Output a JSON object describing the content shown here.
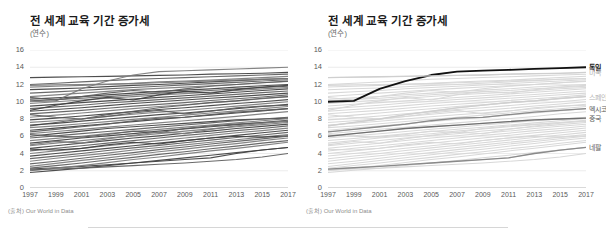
{
  "figure": {
    "divider_visible": true
  },
  "panels": [
    {
      "id": "left",
      "title": "전 세계 교육 기간 증가세",
      "subtitle": "(연수)",
      "source": "(출처) Our World in Data",
      "highlight_mode": "none",
      "country_labels": []
    },
    {
      "id": "right",
      "title": "전 세계 교육 기간 증가세",
      "subtitle": "(연수)",
      "source": "(출처) Our World in Data",
      "highlight_mode": "selected",
      "country_labels": [
        {
          "name": "독일",
          "value": 14.0,
          "style": "hl"
        },
        {
          "name": "미국",
          "value": 13.4,
          "style": "dim"
        },
        {
          "name": "스페인",
          "value": 10.6,
          "style": "dim"
        },
        {
          "name": "멕시코",
          "value": 9.2,
          "style": "mid"
        },
        {
          "name": "중국",
          "value": 8.1,
          "style": "mid"
        },
        {
          "name": "네팔",
          "value": 4.7,
          "style": "mid"
        }
      ]
    }
  ],
  "chart_data": {
    "type": "line",
    "title": "전 세계 교육 기간 증가세",
    "subtitle": "(연수)",
    "xlabel": "",
    "ylabel": "(연수)",
    "source": "(출처) Our World in Data",
    "grid": true,
    "legend_position": "right-inline-labels",
    "xlim": [
      1997,
      2017
    ],
    "ylim": [
      0,
      16
    ],
    "yticks": [
      0,
      2,
      4,
      6,
      8,
      10,
      12,
      14,
      16
    ],
    "xticks": [
      1997,
      1999,
      2001,
      2003,
      2005,
      2007,
      2009,
      2011,
      2013,
      2015,
      2017
    ],
    "x": [
      1997,
      1999,
      2001,
      2003,
      2005,
      2007,
      2009,
      2011,
      2013,
      2015,
      2017
    ],
    "highlighted_series": [
      {
        "name": "독일",
        "color": "#111111",
        "width": 1.8,
        "values": [
          10.0,
          10.1,
          11.5,
          12.4,
          13.1,
          13.5,
          13.6,
          13.7,
          13.8,
          13.9,
          14.0
        ]
      },
      {
        "name": "미국",
        "color": "#cfcfcf",
        "width": 1.3,
        "values": [
          12.8,
          12.85,
          12.9,
          12.95,
          13.0,
          13.05,
          13.1,
          13.2,
          13.25,
          13.3,
          13.4
        ]
      },
      {
        "name": "스페인",
        "color": "#cfcfcf",
        "width": 1.3,
        "values": [
          7.2,
          7.6,
          8.0,
          8.5,
          8.9,
          9.3,
          9.6,
          9.9,
          10.1,
          10.4,
          10.6
        ]
      },
      {
        "name": "멕시코",
        "color": "#8a8a8a",
        "width": 1.3,
        "values": [
          6.5,
          6.8,
          7.1,
          7.4,
          7.8,
          8.1,
          8.2,
          8.5,
          8.8,
          9.0,
          9.2
        ]
      },
      {
        "name": "중국",
        "color": "#6f6f6f",
        "width": 1.3,
        "values": [
          6.0,
          6.3,
          6.6,
          6.9,
          7.1,
          7.3,
          7.5,
          7.7,
          7.9,
          8.0,
          8.1
        ]
      },
      {
        "name": "네팔",
        "color": "#8a8a8a",
        "width": 1.3,
        "values": [
          2.2,
          2.35,
          2.5,
          2.7,
          2.9,
          3.1,
          3.3,
          3.5,
          4.0,
          4.4,
          4.7
        ]
      }
    ],
    "background_series": [
      {
        "values": [
          12.8,
          12.85,
          12.9,
          12.95,
          13.0,
          13.05,
          13.1,
          13.2,
          13.25,
          13.3,
          13.4
        ]
      },
      {
        "values": [
          12.0,
          12.15,
          12.3,
          12.45,
          12.6,
          12.7,
          12.8,
          12.9,
          13.0,
          13.1,
          13.2
        ]
      },
      {
        "values": [
          11.7,
          11.8,
          11.9,
          12.0,
          12.15,
          12.3,
          12.4,
          12.5,
          12.65,
          12.8,
          12.95
        ]
      },
      {
        "values": [
          11.4,
          11.5,
          11.6,
          11.75,
          11.9,
          12.0,
          12.15,
          12.3,
          12.45,
          12.6,
          12.7
        ]
      },
      {
        "values": [
          11.0,
          11.15,
          11.3,
          11.5,
          11.65,
          11.8,
          11.95,
          12.1,
          12.25,
          12.4,
          12.55
        ]
      },
      {
        "values": [
          10.6,
          10.8,
          11.0,
          11.2,
          11.4,
          11.55,
          11.7,
          11.85,
          12.0,
          12.2,
          12.35
        ]
      },
      {
        "values": [
          10.3,
          10.45,
          10.6,
          10.8,
          11.0,
          11.2,
          11.35,
          11.5,
          11.7,
          11.85,
          12.0
        ]
      },
      {
        "values": [
          10.1,
          10.25,
          10.4,
          10.6,
          10.8,
          11.0,
          11.15,
          11.3,
          11.5,
          11.65,
          11.8
        ]
      },
      {
        "values": [
          9.8,
          10.0,
          10.2,
          10.4,
          10.6,
          10.8,
          10.95,
          11.1,
          11.3,
          11.5,
          11.65
        ]
      },
      {
        "values": [
          9.5,
          9.7,
          9.9,
          10.1,
          10.3,
          10.5,
          10.7,
          10.9,
          11.1,
          11.3,
          11.5
        ]
      },
      {
        "values": [
          9.2,
          9.4,
          9.6,
          9.85,
          10.05,
          10.25,
          10.45,
          10.65,
          10.85,
          11.05,
          11.25
        ]
      },
      {
        "values": [
          10.0,
          10.1,
          11.5,
          12.4,
          13.1,
          13.5,
          13.6,
          13.7,
          13.8,
          13.9,
          14.0
        ]
      },
      {
        "values": [
          8.9,
          9.1,
          9.3,
          9.55,
          9.8,
          10.0,
          10.2,
          10.4,
          10.6,
          10.8,
          11.0
        ]
      },
      {
        "values": [
          8.6,
          8.8,
          9.0,
          9.25,
          9.5,
          9.7,
          9.9,
          10.15,
          10.35,
          10.55,
          10.8
        ]
      },
      {
        "values": [
          8.2,
          8.45,
          8.7,
          8.95,
          9.2,
          9.45,
          9.65,
          9.9,
          10.1,
          10.35,
          10.6
        ]
      },
      {
        "values": [
          7.9,
          8.1,
          8.35,
          8.6,
          8.85,
          9.1,
          9.3,
          9.55,
          9.8,
          10.0,
          10.25
        ]
      },
      {
        "values": [
          7.2,
          7.6,
          8.0,
          8.5,
          8.9,
          9.3,
          9.6,
          9.9,
          10.1,
          10.4,
          10.6
        ]
      },
      {
        "values": [
          7.6,
          7.8,
          8.0,
          8.3,
          8.55,
          8.8,
          9.0,
          9.25,
          9.5,
          9.75,
          10.0
        ]
      },
      {
        "values": [
          7.3,
          7.5,
          7.75,
          8.0,
          8.25,
          8.5,
          8.7,
          8.95,
          9.2,
          9.45,
          9.7
        ]
      },
      {
        "values": [
          8.5,
          8.2,
          8.0,
          8.3,
          8.7,
          9.0,
          8.6,
          8.9,
          9.3,
          9.5,
          9.6
        ]
      },
      {
        "values": [
          7.0,
          7.2,
          7.45,
          7.7,
          7.95,
          8.2,
          8.45,
          8.7,
          8.95,
          9.2,
          9.45
        ]
      },
      {
        "values": [
          6.7,
          6.95,
          7.2,
          7.45,
          7.7,
          7.95,
          8.2,
          8.45,
          8.7,
          8.95,
          9.2
        ]
      },
      {
        "values": [
          6.5,
          6.8,
          7.1,
          7.4,
          7.8,
          8.1,
          8.2,
          8.5,
          8.8,
          9.0,
          9.2
        ]
      },
      {
        "values": [
          6.3,
          6.55,
          6.8,
          7.05,
          7.3,
          7.55,
          7.8,
          8.05,
          8.3,
          8.6,
          8.85
        ]
      },
      {
        "values": [
          6.0,
          6.3,
          6.6,
          6.9,
          7.1,
          7.3,
          7.5,
          7.7,
          7.9,
          8.0,
          8.1
        ]
      },
      {
        "values": [
          5.8,
          6.05,
          6.3,
          6.55,
          6.8,
          7.05,
          7.3,
          7.55,
          7.8,
          8.0,
          8.2
        ]
      },
      {
        "values": [
          5.5,
          5.75,
          6.0,
          6.3,
          6.55,
          6.8,
          7.05,
          7.3,
          7.55,
          7.8,
          8.05
        ]
      },
      {
        "values": [
          5.2,
          5.5,
          5.8,
          6.05,
          6.3,
          6.6,
          6.85,
          7.1,
          7.35,
          7.6,
          7.85
        ]
      },
      {
        "values": [
          6.2,
          6.0,
          5.9,
          6.2,
          6.6,
          6.4,
          6.9,
          7.2,
          7.4,
          7.6,
          7.7
        ]
      },
      {
        "values": [
          4.9,
          5.2,
          5.5,
          5.8,
          6.05,
          6.3,
          6.6,
          6.85,
          7.1,
          7.35,
          7.6
        ]
      },
      {
        "values": [
          4.6,
          4.9,
          5.2,
          5.5,
          5.8,
          6.05,
          6.35,
          6.6,
          6.9,
          7.15,
          7.4
        ]
      },
      {
        "values": [
          4.3,
          4.6,
          4.9,
          5.2,
          5.5,
          5.8,
          6.1,
          6.35,
          6.65,
          6.9,
          7.2
        ]
      },
      {
        "values": [
          4.0,
          4.3,
          4.6,
          4.9,
          5.2,
          5.5,
          5.8,
          6.1,
          6.4,
          6.65,
          6.95
        ]
      },
      {
        "values": [
          3.7,
          4.0,
          4.3,
          4.6,
          4.9,
          5.2,
          5.5,
          5.8,
          6.1,
          6.4,
          6.7
        ]
      },
      {
        "values": [
          3.4,
          3.7,
          4.0,
          4.35,
          4.65,
          4.95,
          5.25,
          5.55,
          5.85,
          6.15,
          6.45
        ]
      },
      {
        "values": [
          3.1,
          3.45,
          3.75,
          4.05,
          4.4,
          4.7,
          5.0,
          5.3,
          5.6,
          5.9,
          6.2
        ]
      },
      {
        "values": [
          4.5,
          4.4,
          4.6,
          5.0,
          5.3,
          5.1,
          5.5,
          5.8,
          6.0,
          5.9,
          6.05
        ]
      },
      {
        "values": [
          2.8,
          3.1,
          3.45,
          3.8,
          4.1,
          4.45,
          4.75,
          5.1,
          5.4,
          5.7,
          6.0
        ]
      },
      {
        "values": [
          2.5,
          2.85,
          3.2,
          3.5,
          3.85,
          4.2,
          4.5,
          4.85,
          5.15,
          5.5,
          5.8
        ]
      },
      {
        "values": [
          2.2,
          2.35,
          2.5,
          2.7,
          2.9,
          3.1,
          3.3,
          3.5,
          4.0,
          4.4,
          4.7
        ]
      },
      {
        "values": [
          2.3,
          2.6,
          2.9,
          3.25,
          3.55,
          3.9,
          4.2,
          4.55,
          4.85,
          5.2,
          5.5
        ]
      },
      {
        "values": [
          2.0,
          2.3,
          2.6,
          2.95,
          3.3,
          3.6,
          3.95,
          4.3,
          4.6,
          4.95,
          5.3
        ]
      },
      {
        "values": [
          1.8,
          2.05,
          2.3,
          2.6,
          2.9,
          3.2,
          3.5,
          3.8,
          4.1,
          4.4,
          4.7
        ]
      },
      {
        "values": [
          2.1,
          2.2,
          2.3,
          2.45,
          2.6,
          2.75,
          2.9,
          3.1,
          3.3,
          3.6,
          4.0
        ]
      },
      {
        "values": [
          11.9,
          11.95,
          12.0,
          12.05,
          12.1,
          12.2,
          12.3,
          12.4,
          12.5,
          12.6,
          12.7
        ]
      },
      {
        "values": [
          9.0,
          9.6,
          10.1,
          10.5,
          10.2,
          10.8,
          11.2,
          11.0,
          11.4,
          11.7,
          11.9
        ]
      },
      {
        "values": [
          10.5,
          10.2,
          10.6,
          11.0,
          11.3,
          11.1,
          11.5,
          11.8,
          12.0,
          12.2,
          12.4
        ]
      },
      {
        "values": [
          5.0,
          5.4,
          5.2,
          5.7,
          6.1,
          6.5,
          6.3,
          6.8,
          7.2,
          7.5,
          7.8
        ]
      }
    ]
  }
}
